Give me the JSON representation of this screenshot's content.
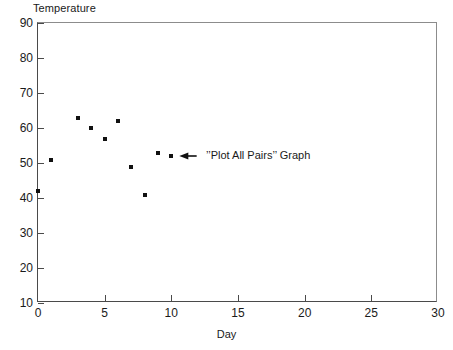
{
  "chart_data": {
    "type": "scatter",
    "title": "",
    "xlabel": "Day",
    "ylabel": "Temperature",
    "xlim": [
      0,
      30
    ],
    "ylim": [
      10,
      90
    ],
    "xticks": [
      0,
      5,
      10,
      15,
      20,
      25,
      30
    ],
    "yticks": [
      10,
      20,
      30,
      40,
      50,
      60,
      70,
      80,
      90
    ],
    "grid": false,
    "legend": "none",
    "marker": "square",
    "marker_color": "#111111",
    "x": [
      0,
      1,
      3,
      4,
      5,
      6,
      7,
      8,
      9,
      10
    ],
    "y": [
      42,
      51,
      63,
      60,
      57,
      62,
      49,
      41,
      53,
      52
    ],
    "points": [
      {
        "day": 0,
        "temperature": 42
      },
      {
        "day": 1,
        "temperature": 51
      },
      {
        "day": 3,
        "temperature": 63
      },
      {
        "day": 4,
        "temperature": 60
      },
      {
        "day": 5,
        "temperature": 57
      },
      {
        "day": 6,
        "temperature": 62
      },
      {
        "day": 7,
        "temperature": 49
      },
      {
        "day": 8,
        "temperature": 41
      },
      {
        "day": 9,
        "temperature": 53
      },
      {
        "day": 10,
        "temperature": 52
      }
    ],
    "annotations": [
      {
        "text": "’’Plot All Pairs’’ Graph",
        "arrow_from_day": 11.9,
        "arrow_to_day": 10.6,
        "arrow_temperature": 52,
        "text_day": 12.6
      }
    ],
    "axis_color": "#4a4a4a",
    "frame_color": "#8c8c8c",
    "background": "#ffffff"
  }
}
